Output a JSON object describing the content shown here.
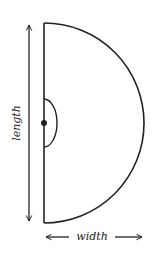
{
  "diagram": {
    "shape": "semicircle",
    "labels": {
      "length": "length",
      "width": "width"
    },
    "colors": {
      "stroke": "#222222",
      "background": "#ffffff"
    },
    "elements": [
      "diameter-line",
      "semicircle-arc",
      "center-point",
      "angle-arc",
      "length-dimension-arrow",
      "width-dimension-arrow"
    ]
  }
}
